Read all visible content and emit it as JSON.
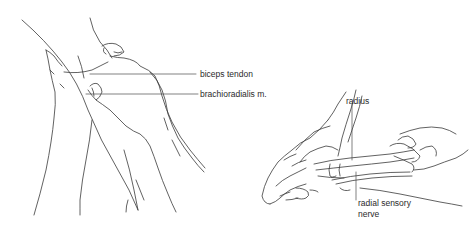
{
  "figure": {
    "left_panel": {
      "description": "Palpation of elbow region with two hands on forearm",
      "labels": {
        "biceps_tendon": "biceps tendon",
        "brachioradialis": "brachioradialis m."
      }
    },
    "right_panel": {
      "description": "Palpation of radial sensory nerve at wrist",
      "labels": {
        "radius": "radius",
        "radial_sensory_nerve_line1": "radial sensory",
        "radial_sensory_nerve_line2": "nerve"
      }
    }
  },
  "colors": {
    "background": "#ffffff",
    "line": "#3a3a3a",
    "text": "#2a2a2a"
  }
}
